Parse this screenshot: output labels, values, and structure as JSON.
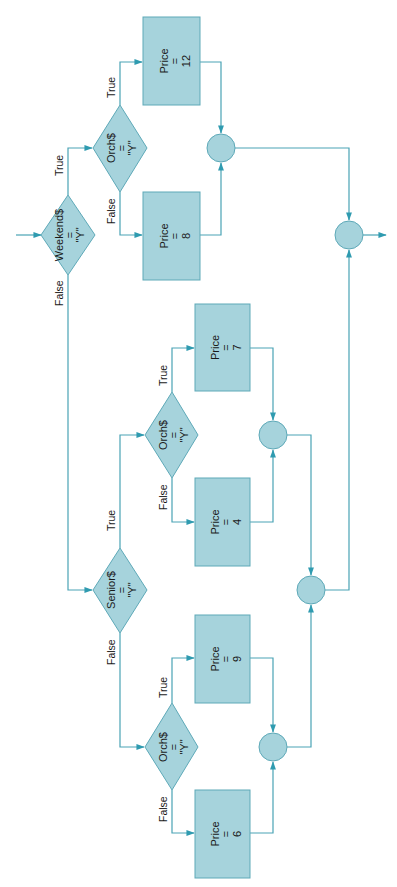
{
  "colors": {
    "shape_fill": "#a6d3dc",
    "shape_stroke": "#5ea9b8",
    "line": "#4aa3b5",
    "arrow": "#2f9bb0",
    "text": "#1a1a1a"
  },
  "labels": {
    "true": "True",
    "false": "False"
  },
  "decisions": {
    "weekend": {
      "var": "Weekend$",
      "op": "=",
      "val": "\"Y\""
    },
    "orch_weekend": {
      "var": "Orch$",
      "op": "=",
      "val": "\"Y\""
    },
    "senior": {
      "var": "Senior$",
      "op": "=",
      "val": "\"Y\""
    },
    "orch_senior": {
      "var": "Orch$",
      "op": "=",
      "val": "\"Y\""
    },
    "orch_regular": {
      "var": "Orch$",
      "op": "=",
      "val": "\"Y\""
    }
  },
  "processes": {
    "price12": {
      "var": "Price",
      "op": "=",
      "val": "12"
    },
    "price8": {
      "var": "Price",
      "op": "=",
      "val": "8"
    },
    "price7": {
      "var": "Price",
      "op": "=",
      "val": "7"
    },
    "price4": {
      "var": "Price",
      "op": "=",
      "val": "4"
    },
    "price9": {
      "var": "Price",
      "op": "=",
      "val": "9"
    },
    "price6": {
      "var": "Price",
      "op": "=",
      "val": "6"
    }
  }
}
